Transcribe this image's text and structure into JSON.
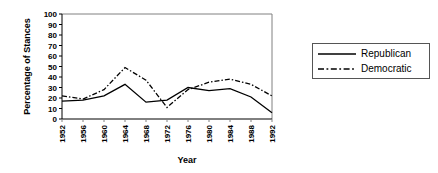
{
  "chart_data": {
    "type": "line",
    "title": "",
    "xlabel": "Year",
    "ylabel": "Percentage of Stances",
    "categories": [
      1952,
      1956,
      1960,
      1964,
      1968,
      1972,
      1976,
      1980,
      1984,
      1988,
      1992
    ],
    "xtick_labels": [
      "1952",
      "1956",
      "1960",
      "1964",
      "1968",
      "1972",
      "1976",
      "1980",
      "1984",
      "1988",
      "1992"
    ],
    "ytick_labels": [
      "0",
      "10",
      "20",
      "30",
      "40",
      "50",
      "60",
      "70",
      "80",
      "90",
      "100"
    ],
    "ylim": [
      0,
      100
    ],
    "ytick_step": 10,
    "grid": false,
    "legend_position": "right-outside",
    "series": [
      {
        "name": "Republican",
        "style": "solid",
        "color": "#000000",
        "values": [
          17,
          18,
          22,
          33,
          16,
          18,
          30,
          27,
          29,
          21,
          6
        ]
      },
      {
        "name": "Democratic",
        "style": "dash-dot",
        "color": "#000000",
        "values": [
          22,
          19,
          28,
          49,
          37,
          11,
          28,
          35,
          38,
          33,
          22
        ]
      }
    ]
  },
  "legend": {
    "entries": [
      {
        "label": "Republican",
        "style": "solid"
      },
      {
        "label": "Democratic",
        "style": "dash-dot"
      }
    ]
  },
  "colors": {
    "ink": "#000000",
    "frame": "#808080",
    "background": "#ffffff"
  }
}
